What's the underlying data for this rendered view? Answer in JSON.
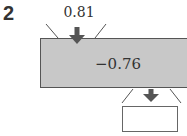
{
  "question": {
    "number": "2"
  },
  "function_machine": {
    "input": "0.81",
    "operation": "−0.76",
    "output": "",
    "colors": {
      "machine_fill": "#c8c8c8",
      "machine_border": "#555555",
      "arrow": "#555555",
      "text": "#333333"
    }
  }
}
